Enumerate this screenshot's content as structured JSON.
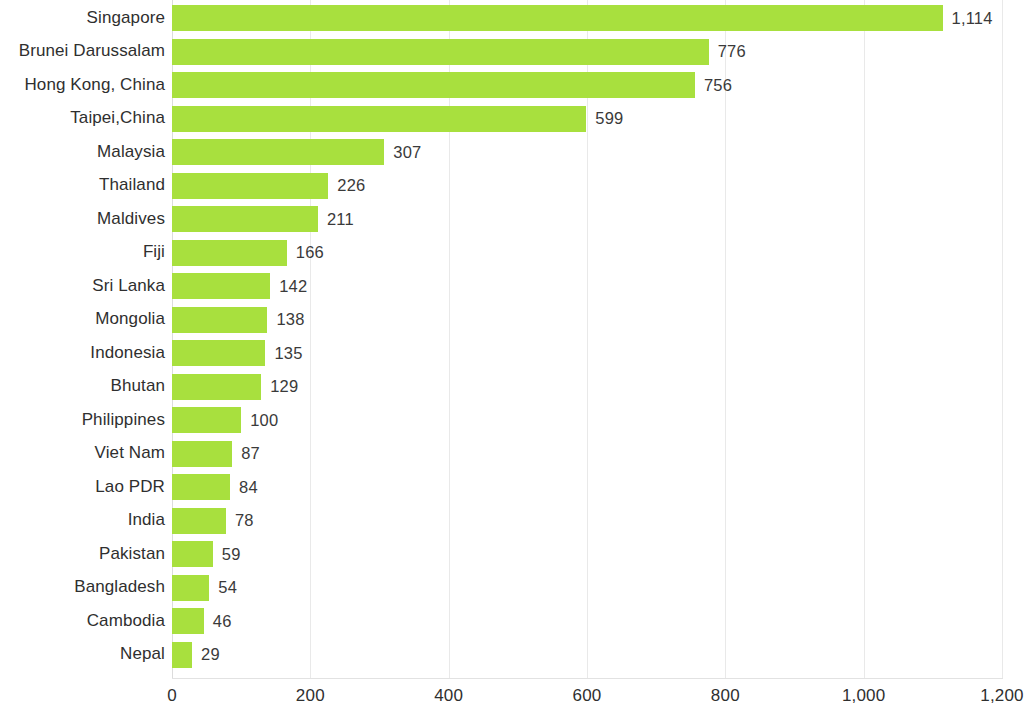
{
  "chart_data": {
    "type": "bar",
    "orientation": "horizontal",
    "title": "",
    "subtitle": "",
    "xlabel": "",
    "ylabel": "",
    "xlim": [
      0,
      1200
    ],
    "xticks": [
      0,
      200,
      400,
      600,
      800,
      1000,
      1200
    ],
    "xtick_labels": [
      "0",
      "200",
      "400",
      "600",
      "800",
      "1,000",
      "1,200"
    ],
    "grid": "vertical-only",
    "legend": "none",
    "bar_color": "#a8e03e",
    "label_color": "#2f2f2f",
    "value_color": "#3a3a3a",
    "gridline_color": "#e9e9e9",
    "categories": [
      "Singapore",
      "Brunei Darussalam",
      "Hong Kong, China",
      "Taipei,China",
      "Malaysia",
      "Thailand",
      "Maldives",
      "Fiji",
      "Sri Lanka",
      "Mongolia",
      "Indonesia",
      "Bhutan",
      "Philippines",
      "Viet Nam",
      "Lao PDR",
      "India",
      "Pakistan",
      "Bangladesh",
      "Cambodia",
      "Nepal"
    ],
    "values": [
      1114,
      776,
      756,
      599,
      307,
      226,
      211,
      166,
      142,
      138,
      135,
      129,
      100,
      87,
      84,
      78,
      59,
      54,
      46,
      29
    ],
    "value_labels": [
      "1,114",
      "776",
      "756",
      "599",
      "307",
      "226",
      "211",
      "166",
      "142",
      "138",
      "135",
      "129",
      "100",
      "87",
      "84",
      "78",
      "59",
      "54",
      "46",
      "29"
    ]
  }
}
